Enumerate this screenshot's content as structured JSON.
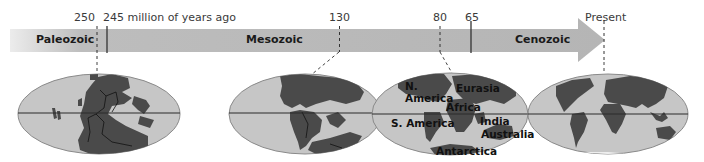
{
  "timeline": {
    "unit_label": "million of years ago",
    "ticks": [
      {
        "label": "250",
        "value": 250,
        "style": "dashed"
      },
      {
        "label": "245 million of years ago",
        "value": 245,
        "style": "solid"
      },
      {
        "label": "130",
        "value": 130,
        "style": "dashed"
      },
      {
        "label": "80",
        "value": 80,
        "style": "dashed"
      },
      {
        "label": "65",
        "value": 65,
        "style": "solid"
      },
      {
        "label": "Present",
        "value": 0,
        "style": "dashed"
      }
    ],
    "eras": [
      {
        "name": "Paleozoic"
      },
      {
        "name": "Mesozoic"
      },
      {
        "name": "Cenozoic"
      }
    ],
    "colors": {
      "arrow": "#b8b8b8",
      "arrow_fade": "#e6e6e6",
      "ocean": "#c6c6c6",
      "land": "#4a4a4a",
      "equator": "#2a2a2a"
    }
  },
  "maps": [
    {
      "name": "250 million years ago",
      "labels": []
    },
    {
      "name": "130 million years ago",
      "labels": []
    },
    {
      "name": "80 million years ago",
      "labels": [
        {
          "text": "N."
        },
        {
          "text": "America"
        },
        {
          "text": "Eurasia"
        },
        {
          "text": "Africa"
        },
        {
          "text": "S. America"
        },
        {
          "text": "India"
        },
        {
          "text": "Australia"
        },
        {
          "text": "Antarctica"
        }
      ]
    },
    {
      "name": "Present",
      "labels": []
    }
  ]
}
